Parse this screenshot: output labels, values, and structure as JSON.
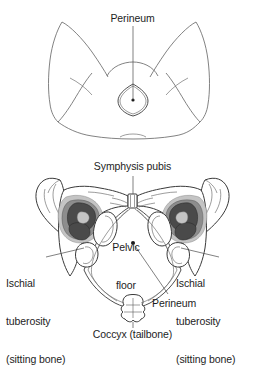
{
  "figure": {
    "background_color": "#ffffff",
    "ink_color": "#3a3a3a",
    "panels": [
      {
        "id": "top",
        "name": "external-perineum-view",
        "description": "Line drawing of lower body from below, legs apart, with diamond-shaped perineum marked",
        "labels": [
          {
            "name": "perineum",
            "text": "Perineum"
          }
        ]
      },
      {
        "id": "bottom",
        "name": "pelvic-bone-view",
        "description": "Line drawing of the bony pelvis viewed from below showing the pelvic outlet",
        "labels": [
          {
            "name": "symphysis-pubis",
            "text": "Symphysis pubis"
          },
          {
            "name": "pelvic-floor",
            "text": "Pelvic\nfloor"
          },
          {
            "name": "ischial-tuberosity-left",
            "text": "Ischial\ntuberosity\n(sitting bone)"
          },
          {
            "name": "ischial-tuberosity-right",
            "text": "Ischial\ntuberosity\n(sitting bone)"
          },
          {
            "name": "perineum",
            "text": "Perineum"
          },
          {
            "name": "coccyx",
            "text": "Coccyx (tailbone)"
          }
        ]
      }
    ]
  },
  "labels": {
    "perineum_top": "Perineum",
    "symphysis_pubis": "Symphysis pubis",
    "pelvic_floor_line1": "Pelvic",
    "pelvic_floor_line2": "floor",
    "ischial_line1": "Ischial",
    "ischial_line2": "tuberosity",
    "ischial_line3": "(sitting bone)",
    "perineum_bottom": "Perineum",
    "coccyx": "Coccyx (tailbone)"
  }
}
